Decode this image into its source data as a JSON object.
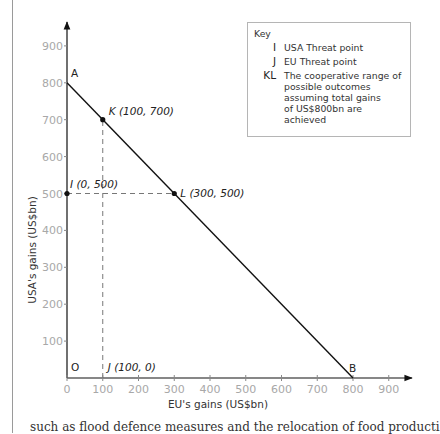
{
  "chart_data": {
    "type": "line",
    "title": "",
    "xlabel": "EU's gains (US$bn)",
    "ylabel": "USA's gains (US$bn)",
    "xlim": [
      0,
      950
    ],
    "ylim": [
      0,
      950
    ],
    "x_ticks": [
      0,
      100,
      200,
      300,
      400,
      500,
      600,
      700,
      800,
      900
    ],
    "y_ticks": [
      100,
      200,
      300,
      400,
      500,
      600,
      700,
      800,
      900
    ],
    "grid": false,
    "series": [
      {
        "name": "Possible outcomes (total gains US$800bn)",
        "x": [
          0,
          800
        ],
        "y": [
          800,
          0
        ],
        "style": "solid"
      }
    ],
    "points": [
      {
        "id": "A",
        "x": 0,
        "y": 800,
        "label": "A",
        "dot": false
      },
      {
        "id": "B",
        "x": 800,
        "y": 0,
        "label": "B",
        "dot": false
      },
      {
        "id": "O",
        "x": 0,
        "y": 0,
        "label": "O",
        "dot": false
      },
      {
        "id": "K",
        "x": 100,
        "y": 700,
        "label": "K (100, 700)",
        "dot": true
      },
      {
        "id": "L",
        "x": 300,
        "y": 500,
        "label": "L (300, 500)",
        "dot": true
      },
      {
        "id": "I",
        "x": 0,
        "y": 500,
        "label": "I (0, 500)",
        "dot": true
      },
      {
        "id": "J",
        "x": 100,
        "y": 0,
        "label": "J (100, 0)",
        "dot": false
      }
    ],
    "reference_lines": [
      {
        "orientation": "horizontal",
        "y": 500,
        "from_x": 0,
        "to_x": 300,
        "style": "dashed"
      },
      {
        "orientation": "vertical",
        "x": 100,
        "from_y": 0,
        "to_y": 700,
        "style": "dashed"
      }
    ],
    "legend": {
      "title": "Key",
      "placement": "top-right",
      "entries": [
        {
          "symbol": "I",
          "text": "USA Threat point"
        },
        {
          "symbol": "J",
          "text": "EU Threat point"
        },
        {
          "symbol": "KL",
          "text": "The cooperative range of possible outcomes assuming total gains of US$800bn are achieved"
        }
      ]
    }
  },
  "key": {
    "title": "Key",
    "entries": [
      {
        "symbol": "I",
        "lines": [
          "USA Threat point"
        ]
      },
      {
        "symbol": "J",
        "lines": [
          "EU Threat point"
        ]
      },
      {
        "symbol": "KL",
        "lines": [
          "The cooperative range of",
          "possible outcomes",
          "assuming total gains",
          "of US$800bn are achieved"
        ]
      }
    ]
  },
  "footer_text": "such as flood defence measures and the relocation of food producti"
}
